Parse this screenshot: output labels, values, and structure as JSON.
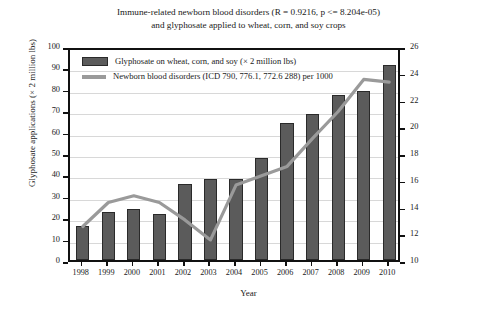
{
  "chart_data": {
    "type": "bar",
    "title_line1": "Immune-related newborn blood disorders (R = 0.9216, p <= 8.204e-05)",
    "title_line2": "and glyphosate applied to wheat, corn, and soy crops",
    "xlabel": "Year",
    "ylabel_left": "Glyphosate applications (× 2 million lbs)",
    "ylabel_right": "Discharge rate of newborn blood disorders per 1000",
    "categories": [
      "1998",
      "1999",
      "2000",
      "2001",
      "2002",
      "2003",
      "2004",
      "2005",
      "2006",
      "2007",
      "2008",
      "2009",
      "2010"
    ],
    "ylim_left": [
      0,
      100
    ],
    "ytick_left": [
      0,
      10,
      20,
      30,
      40,
      50,
      60,
      70,
      80,
      90,
      100
    ],
    "ylim_right": [
      10,
      26
    ],
    "ytick_right": [
      10,
      12,
      14,
      16,
      18,
      20,
      22,
      24,
      26
    ],
    "grid": true,
    "legend_position": "top-left inside",
    "series": [
      {
        "name": "Glyphosate on wheat, corn, and soy (× 2 million lbs)",
        "type": "bar",
        "axis": "left",
        "color": "#5b5b5b",
        "values": [
          16,
          22.5,
          24,
          21.5,
          35.5,
          38,
          38,
          47.5,
          64,
          68,
          77,
          79,
          91
        ]
      },
      {
        "name": "Newborn blood disorders (ICD 790, 776.1, 772.6 288) per 1000",
        "type": "line",
        "axis": "right",
        "color": "#9a9a9a",
        "values": [
          12.8,
          14.6,
          15.1,
          14.6,
          13.3,
          11.8,
          15.9,
          16.6,
          17.3,
          19.4,
          21.4,
          23.8,
          23.6
        ]
      }
    ]
  },
  "legend": {
    "items": [
      {
        "label": "Glyphosate on wheat, corn, and soy (× 2 million lbs)",
        "marker": "bar-swatch"
      },
      {
        "label": "Newborn blood disorders (ICD 790, 776.1, 772.6 288) per 1000",
        "marker": "line-swatch"
      }
    ]
  }
}
